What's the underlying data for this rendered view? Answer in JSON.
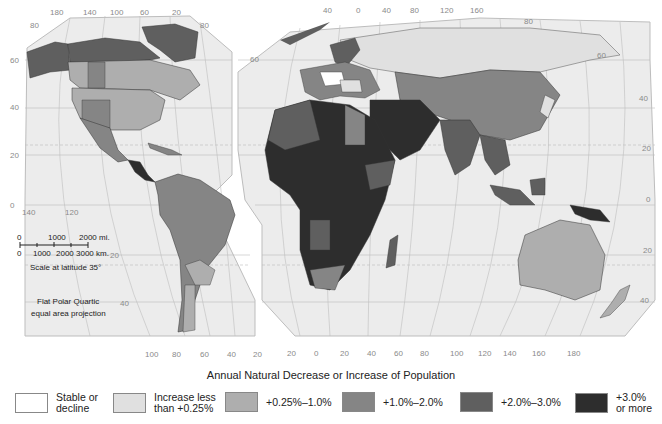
{
  "legend": {
    "title": "Annual Natural Decrease or Increase of Population",
    "items": [
      {
        "label": "Stable or\ndecline",
        "color": "#ffffff"
      },
      {
        "label": "Increase less\nthan +0.25%",
        "color": "#e0e0e0"
      },
      {
        "label": "+0.25%–1.0%",
        "color": "#aeaeae"
      },
      {
        "label": "+1.0%–2.0%",
        "color": "#858585"
      },
      {
        "label": "+2.0%–3.0%",
        "color": "#5f5f5f"
      },
      {
        "label": "+3.0%\nor more",
        "color": "#2d2d2d"
      }
    ]
  },
  "map": {
    "ocean_color": "#ececec",
    "graticule_color": "#b8b8b8",
    "americas_panel": {
      "top_longitudes": [
        "180",
        "140",
        "100",
        "60",
        "20"
      ],
      "bottom_longitudes": [
        "100",
        "80",
        "60",
        "40",
        "20"
      ],
      "left_latitudes": [
        "80",
        "60",
        "40",
        "20",
        "0"
      ],
      "inner_labels": [
        "140",
        "120"
      ],
      "right_latitudes": [
        "80",
        "20",
        "40"
      ]
    },
    "eurasia_panel": {
      "top_longitudes": [
        "40",
        "0",
        "40",
        "80",
        "120",
        "160"
      ],
      "bottom_longitudes": [
        "20",
        "0",
        "20",
        "40",
        "60",
        "80",
        "100",
        "120",
        "140",
        "160",
        "180"
      ],
      "left_latitudes": [
        "60"
      ],
      "right_latitudes": [
        "80",
        "60",
        "40",
        "20",
        "0",
        "20",
        "40"
      ]
    },
    "scale": {
      "miles_labels": [
        "0",
        "1000",
        "2000 mi."
      ],
      "km_labels": [
        "0",
        "1000",
        "2000",
        "3000 km."
      ],
      "note": "Scale at latitude 35°"
    },
    "projection": {
      "line1": "Flat Polar Quartic",
      "line2": "equal area projection"
    }
  }
}
